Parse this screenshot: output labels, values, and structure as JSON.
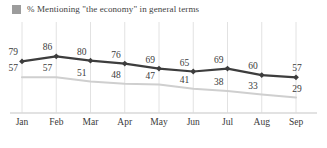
{
  "legend": {
    "marker_icon": "square-swatch-icon",
    "label": "% Mentioning \"the economy\" in general terms",
    "color": "#9c9c9c"
  },
  "chart_data": {
    "type": "line",
    "title": "",
    "subtitle": "",
    "xlabel": "",
    "ylabel": "",
    "categories": [
      "Jan",
      "Feb",
      "Mar",
      "Apr",
      "May",
      "Jun",
      "Jul",
      "Aug",
      "Sep"
    ],
    "ylim": [
      0,
      100
    ],
    "grid": "vertical",
    "legend_position": "top-left",
    "series": [
      {
        "name": "dark-series",
        "color": "#3d3d3d",
        "marker": "diamond",
        "show_labels": true,
        "values": [
          79,
          86,
          80,
          76,
          69,
          65,
          69,
          60,
          57
        ]
      },
      {
        "name": "light-series",
        "color": "#cfcfcf",
        "marker": "none",
        "show_labels": true,
        "values": [
          57,
          57,
          51,
          48,
          47,
          41,
          38,
          33,
          29
        ]
      }
    ]
  },
  "axis": {
    "baseline_color": "#d8d8d8",
    "gridline_color": "#e2e2e2"
  }
}
